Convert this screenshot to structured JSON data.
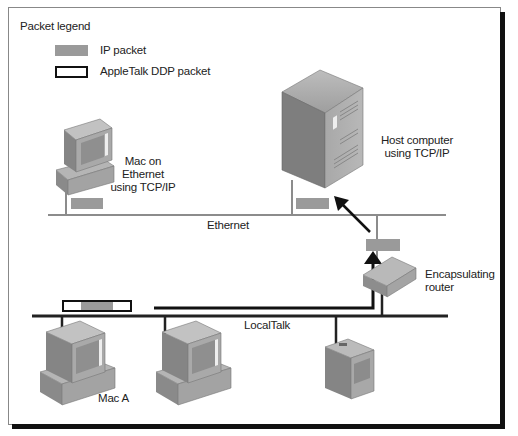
{
  "legend": {
    "title": "Packet legend",
    "items": [
      {
        "label": "IP packet",
        "style": "filled-gray"
      },
      {
        "label": "AppleTalk DDP packet",
        "style": "outlined"
      }
    ]
  },
  "networks": {
    "ethernet_label": "Ethernet",
    "localtalk_label": "LocalTalk"
  },
  "nodes": {
    "mac_ethernet_label": [
      "Mac on",
      "Ethernet",
      "using TCP/IP"
    ],
    "host_label": [
      "Host computer",
      "using TCP/IP"
    ],
    "router_label": [
      "Encapsulating",
      "router"
    ],
    "mac_a_label": "Mac A"
  },
  "colors": {
    "ip_packet": "#9a9a9a",
    "ethernet_line": "#8c8c8c",
    "localtalk_line": "#222222",
    "frame_shadow": "#111111"
  }
}
